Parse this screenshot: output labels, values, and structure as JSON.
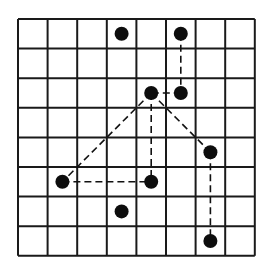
{
  "diagram": {
    "type": "grid-path",
    "grid": {
      "cols": 8,
      "rows": 8,
      "x0": 18,
      "y0": 19,
      "cell": 29.6,
      "line_color": "#1a1a1a",
      "line_width": 2
    },
    "dot_color": "#0d0d0d",
    "dot_radius": 7,
    "dots": [
      {
        "col": 3,
        "row": 0
      },
      {
        "col": 5,
        "row": 0
      },
      {
        "col": 4,
        "row": 2
      },
      {
        "col": 5,
        "row": 2
      },
      {
        "col": 6,
        "row": 4
      },
      {
        "col": 1,
        "row": 5
      },
      {
        "col": 4,
        "row": 5
      },
      {
        "col": 3,
        "row": 6
      },
      {
        "col": 6,
        "row": 7
      }
    ],
    "dashed_segments": [
      {
        "from": [
          5,
          0
        ],
        "to": [
          5,
          2
        ]
      },
      {
        "from": [
          5,
          2
        ],
        "to": [
          4,
          2
        ]
      },
      {
        "from": [
          4,
          2
        ],
        "to": [
          4,
          5
        ]
      },
      {
        "from": [
          4,
          2
        ],
        "to": [
          1,
          5
        ]
      },
      {
        "from": [
          1,
          5
        ],
        "to": [
          4,
          5
        ]
      },
      {
        "from": [
          4,
          2
        ],
        "to": [
          6,
          4
        ]
      },
      {
        "from": [
          6,
          4
        ],
        "to": [
          6,
          7
        ]
      }
    ]
  }
}
